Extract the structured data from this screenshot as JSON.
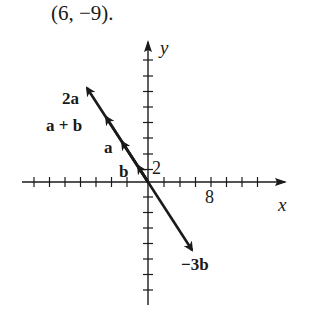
{
  "caption": "(6, −9).",
  "axes": {
    "x_label": "x",
    "y_label": "y",
    "x_tick_label": "8",
    "y_tick_label": "2",
    "x_tick_step": 1,
    "y_tick_step": 1
  },
  "vectors": [
    {
      "label": "b",
      "x": -1,
      "y": 2
    },
    {
      "label": "a",
      "x": -3,
      "y": 5
    },
    {
      "label": "a + b",
      "x": -4,
      "y": 7
    },
    {
      "label": "2a",
      "x": -6,
      "y": 10
    },
    {
      "label": "−3b",
      "x": 3,
      "y": -6
    }
  ],
  "labels": {
    "two_a": "2a",
    "a_plus_b": "a + b",
    "a": "a",
    "b": "b",
    "neg_three_b": "−3b"
  },
  "colors": {
    "ink": "#1a1a1a",
    "background": "#ffffff"
  }
}
